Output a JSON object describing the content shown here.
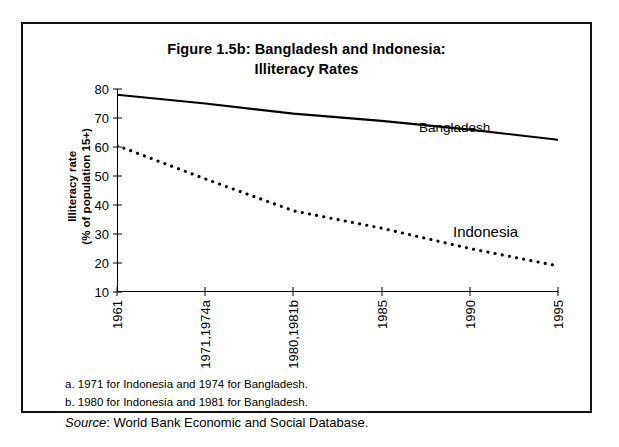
{
  "figure": {
    "title_line1": "Figure 1.5b: Bangladesh and Indonesia:",
    "title_line2": "Illiteracy Rates",
    "y_axis_title_line1": "Illiteracy rate",
    "y_axis_title_line2": "(% of population 15+)",
    "footnote_a": "a. 1971 for Indonesia and 1974 for Bangladesh.",
    "footnote_b": "b.  1980 for Indonesia and 1981 for Bangladesh.",
    "source_word": "Source",
    "source_text": ": World Bank Economic and Social Database."
  },
  "chart_data": {
    "type": "line",
    "title": "Figure 1.5b: Bangladesh and Indonesia: Illiteracy Rates",
    "xlabel": "",
    "ylabel": "Illiteracy rate (% of population 15+)",
    "ylim": [
      10,
      80
    ],
    "yticks": [
      10,
      20,
      30,
      40,
      50,
      60,
      70,
      80
    ],
    "ytick_labels": [
      "10",
      "20",
      "30",
      "40",
      "50",
      "60",
      "70",
      "80"
    ],
    "x": [
      1961,
      1971,
      1980,
      1985,
      1990,
      1995
    ],
    "xtick_labels": [
      "1961",
      "1971,1974a",
      "1980,1981b",
      "1985",
      "1990",
      "1995"
    ],
    "grid": false,
    "legend": "inline-labels",
    "series": [
      {
        "name": "Bangladesh",
        "style": "solid",
        "color": "#000000",
        "label_position": "above-line-right",
        "values": [
          78.0,
          75.0,
          71.5,
          69.0,
          66.0,
          62.5
        ]
      },
      {
        "name": "Indonesia",
        "style": "dotted",
        "color": "#000000",
        "label_position": "above-line-right",
        "values": [
          60.5,
          49.0,
          38.0,
          32.0,
          25.0,
          19.0
        ]
      }
    ],
    "annotations": [
      "a. 1971 for Indonesia and 1974 for Bangladesh.",
      "b.  1980 for Indonesia and 1981 for Bangladesh.",
      "Source: World Bank Economic and Social Database."
    ]
  }
}
